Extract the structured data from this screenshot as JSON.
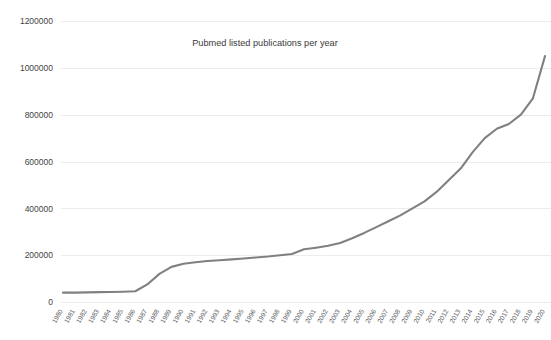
{
  "chart_data": {
    "type": "line",
    "title": "Pubmed listed publications per year",
    "xlabel": "",
    "ylabel": "",
    "ylim": [
      0,
      1200000
    ],
    "ytick_labels": [
      "0",
      "200000",
      "400000",
      "600000",
      "800000",
      "1000000",
      "1200000"
    ],
    "ytick_values": [
      0,
      200000,
      400000,
      600000,
      800000,
      1000000,
      1200000
    ],
    "grid": true,
    "legend": "none",
    "line_color": "#808080",
    "categories": [
      "1980",
      "1981",
      "1982",
      "1983",
      "1984",
      "1985",
      "1986",
      "1987",
      "1988",
      "1989",
      "1990",
      "1991",
      "1992",
      "1993",
      "1994",
      "1995",
      "1996",
      "1997",
      "1998",
      "1999",
      "2000",
      "2001",
      "2002",
      "2003",
      "2004",
      "2005",
      "2006",
      "2007",
      "2008",
      "2009",
      "2010",
      "2011",
      "2012",
      "2013",
      "2014",
      "2015",
      "2016",
      "2017",
      "2018",
      "2019",
      "2020"
    ],
    "values": [
      40000,
      40000,
      41000,
      42000,
      43000,
      44000,
      46000,
      75000,
      120000,
      150000,
      163000,
      170000,
      175000,
      178000,
      182000,
      186000,
      190000,
      194000,
      200000,
      205000,
      225000,
      232000,
      240000,
      252000,
      272000,
      295000,
      320000,
      345000,
      370000,
      400000,
      430000,
      470000,
      520000,
      570000,
      640000,
      700000,
      740000,
      760000,
      800000,
      870000,
      1050000
    ]
  }
}
